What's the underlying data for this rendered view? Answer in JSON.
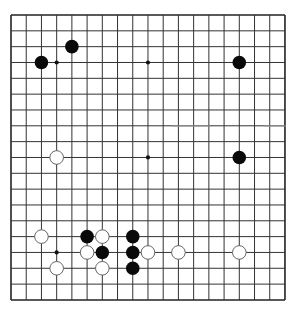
{
  "board": {
    "size": 19,
    "origin_x": 11,
    "origin_y": 15,
    "spacing_x": 15.22,
    "spacing_y": 15.83,
    "line_color": "#333333",
    "border_color": "#222222",
    "background": "#ffffff",
    "star_points": [
      [
        3,
        3
      ],
      [
        9,
        3
      ],
      [
        15,
        3
      ],
      [
        3,
        9
      ],
      [
        9,
        9
      ],
      [
        15,
        9
      ],
      [
        3,
        15
      ],
      [
        9,
        15
      ],
      [
        15,
        15
      ]
    ]
  },
  "stones": {
    "black": [
      [
        4,
        2
      ],
      [
        2,
        3
      ],
      [
        15,
        3
      ],
      [
        15,
        9
      ],
      [
        5,
        14
      ],
      [
        8,
        14
      ],
      [
        6,
        15
      ],
      [
        8,
        15
      ],
      [
        8,
        16
      ]
    ],
    "white": [
      [
        3,
        9
      ],
      [
        2,
        14
      ],
      [
        6,
        14
      ],
      [
        5,
        15
      ],
      [
        9,
        15
      ],
      [
        11,
        15
      ],
      [
        15,
        15
      ],
      [
        3,
        16
      ],
      [
        6,
        16
      ]
    ],
    "black_color": "#0a0a0a",
    "white_fill": "#ffffff",
    "white_outline": "#666666"
  },
  "artifacts": [
    {
      "x1": 173,
      "x2": 210,
      "y": 126
    },
    {
      "x1": 265,
      "x2": 285,
      "y": 126
    }
  ]
}
